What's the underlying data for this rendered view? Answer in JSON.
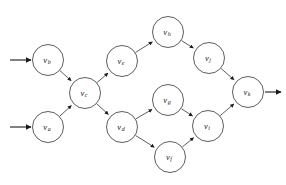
{
  "diagram": {
    "type": "directed-graph",
    "background_color": "#ffffff",
    "stroke_color": "#333333",
    "label_color": "#1a1a1a",
    "node_radius": 15.5,
    "nodes": [
      {
        "id": "vb",
        "label_base": "v",
        "label_sub": "b",
        "cx": 48,
        "cy": 60,
        "role": "source"
      },
      {
        "id": "va",
        "label_base": "v",
        "label_sub": "a",
        "cx": 48,
        "cy": 127,
        "role": "source"
      },
      {
        "id": "vc",
        "label_base": "v",
        "label_sub": "c",
        "cx": 85,
        "cy": 93,
        "role": "merge"
      },
      {
        "id": "ve",
        "label_base": "v",
        "label_sub": "e",
        "cx": 122,
        "cy": 61,
        "role": "branch"
      },
      {
        "id": "vd",
        "label_base": "v",
        "label_sub": "d",
        "cx": 122,
        "cy": 127,
        "role": "branch"
      },
      {
        "id": "vh",
        "label_base": "v",
        "label_sub": "h",
        "cx": 168,
        "cy": 32,
        "role": "task"
      },
      {
        "id": "vg",
        "label_base": "v",
        "label_sub": "g",
        "cx": 168,
        "cy": 100,
        "role": "task"
      },
      {
        "id": "vf",
        "label_base": "v",
        "label_sub": "f",
        "cx": 170,
        "cy": 157,
        "role": "task"
      },
      {
        "id": "vj",
        "label_base": "v",
        "label_sub": "j",
        "cx": 209,
        "cy": 58,
        "role": "task"
      },
      {
        "id": "vi",
        "label_base": "v",
        "label_sub": "i",
        "cx": 208,
        "cy": 126,
        "role": "merge"
      },
      {
        "id": "vk",
        "label_base": "v",
        "label_sub": "k",
        "cx": 248,
        "cy": 92,
        "role": "sink"
      }
    ],
    "edges": [
      {
        "from": "vb",
        "to": "vc"
      },
      {
        "from": "va",
        "to": "vc"
      },
      {
        "from": "vc",
        "to": "ve"
      },
      {
        "from": "vc",
        "to": "vd"
      },
      {
        "from": "ve",
        "to": "vh"
      },
      {
        "from": "vd",
        "to": "vg"
      },
      {
        "from": "vd",
        "to": "vf"
      },
      {
        "from": "vh",
        "to": "vj"
      },
      {
        "from": "vg",
        "to": "vi"
      },
      {
        "from": "vf",
        "to": "vi"
      },
      {
        "from": "vj",
        "to": "vk"
      },
      {
        "from": "vi",
        "to": "vk"
      }
    ],
    "external_arrows": [
      {
        "id": "input-vb",
        "kind": "input",
        "x1": 10,
        "y1": 60,
        "x2": 31,
        "y2": 60,
        "target": "vb"
      },
      {
        "id": "input-va",
        "kind": "input",
        "x1": 10,
        "y1": 127,
        "x2": 31,
        "y2": 127,
        "target": "va"
      },
      {
        "id": "output-vk",
        "kind": "output",
        "x1": 265,
        "y1": 92,
        "x2": 281,
        "y2": 92,
        "source": "vk"
      }
    ]
  }
}
